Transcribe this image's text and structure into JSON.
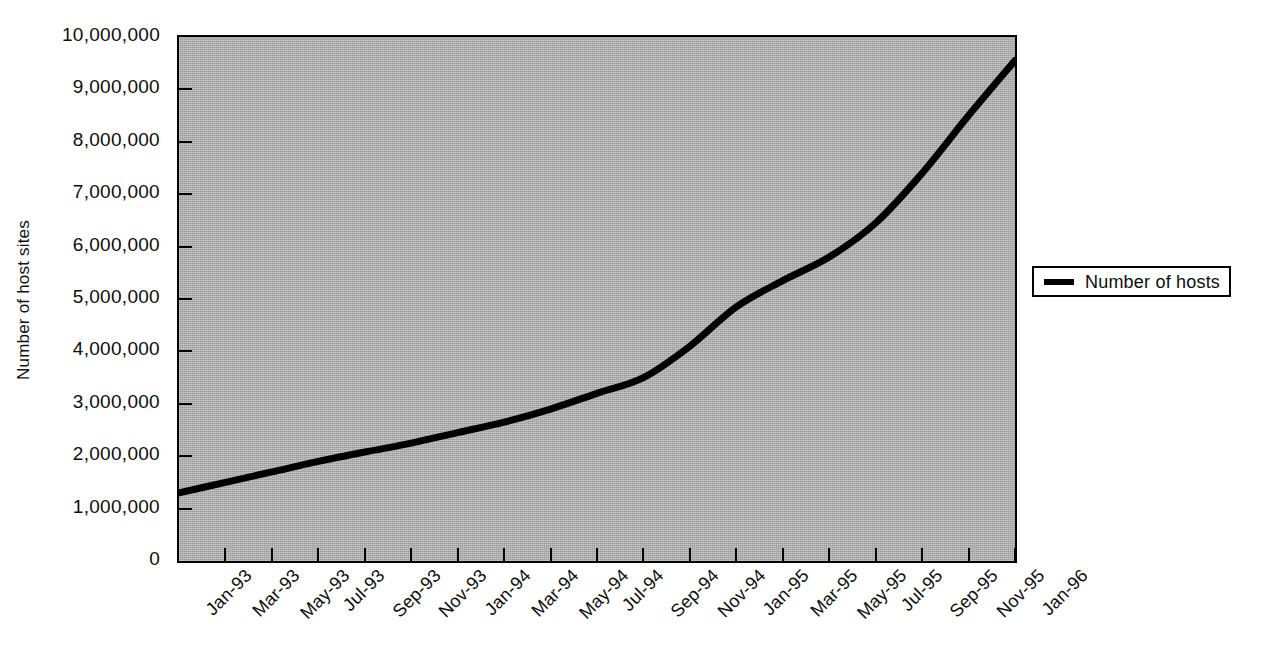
{
  "chart_data": {
    "type": "line",
    "title": "",
    "xlabel": "",
    "ylabel": "Number of host sites",
    "ylim": [
      0,
      10000000
    ],
    "grid": false,
    "legend_position": "right",
    "plot_background": "#a9a9a9",
    "series_color": "#000000",
    "categories": [
      "Jan-93",
      "Mar-93",
      "May-93",
      "Jul-93",
      "Sep-93",
      "Nov-93",
      "Jan-94",
      "Mar-94",
      "May-94",
      "Jul-94",
      "Sep-94",
      "Nov-94",
      "Jan-95",
      "Mar-95",
      "May-95",
      "Jul-95",
      "Sep-95",
      "Nov-95",
      "Jan-96"
    ],
    "series": [
      {
        "name": "Number of hosts",
        "values": [
          1300000,
          1500000,
          1700000,
          1900000,
          2080000,
          2250000,
          2450000,
          2650000,
          2900000,
          3200000,
          3500000,
          4100000,
          4850000,
          5350000,
          5800000,
          6450000,
          7400000,
          8500000,
          9550000
        ]
      }
    ],
    "y_ticks": [
      0,
      1000000,
      2000000,
      3000000,
      4000000,
      5000000,
      6000000,
      7000000,
      8000000,
      9000000,
      10000000
    ],
    "y_tick_labels": [
      "0",
      "1,000,000",
      "2,000,000",
      "3,000,000",
      "4,000,000",
      "5,000,000",
      "6,000,000",
      "7,000,000",
      "8,000,000",
      "9,000,000",
      "10,000,000"
    ]
  },
  "axis": {
    "y_title": "Number of host sites"
  },
  "legend": {
    "entries": [
      {
        "label": "Number of hosts",
        "color": "#000000"
      }
    ]
  }
}
